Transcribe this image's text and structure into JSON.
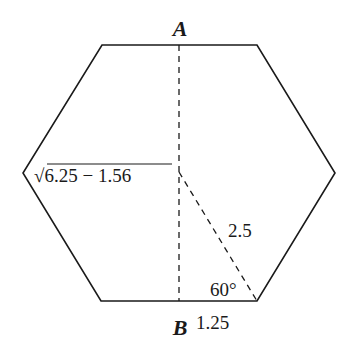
{
  "diagram": {
    "type": "hexagon",
    "points": {
      "A": {
        "label": "A"
      },
      "B": {
        "label": "B"
      }
    },
    "labels": {
      "height": "√6.25 − 1.56",
      "hypotenuse": "2.5",
      "angle": "60°",
      "half_base": "1.25"
    },
    "colors": {
      "stroke": "#1a1a1a",
      "background": "#ffffff"
    }
  }
}
